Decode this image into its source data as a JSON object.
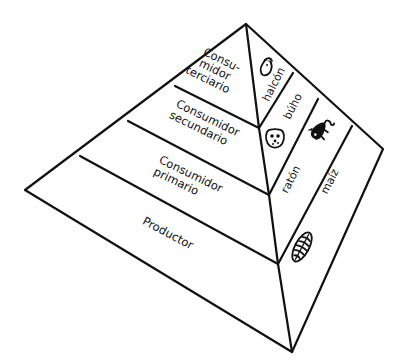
{
  "diagram": {
    "type": "food-pyramid",
    "language": "es",
    "colors": {
      "line": "#111111",
      "background": "#ffffff"
    },
    "trophic_levels": [
      {
        "id": "tertiary",
        "label_lines": [
          "Consu-",
          "midor",
          "terciario"
        ],
        "organism": "halcón",
        "icon": "hawk-icon"
      },
      {
        "id": "secondary",
        "label_lines": [
          "Consumidor",
          "secundario"
        ],
        "organism": "búho",
        "icon": "owl-icon"
      },
      {
        "id": "primary",
        "label_lines": [
          "Consumidor",
          "primario"
        ],
        "organism": "ratón",
        "icon": "mouse-icon"
      },
      {
        "id": "producer",
        "label_lines": [
          "Productor"
        ],
        "organism": "maíz",
        "icon": "corn-icon"
      }
    ]
  }
}
